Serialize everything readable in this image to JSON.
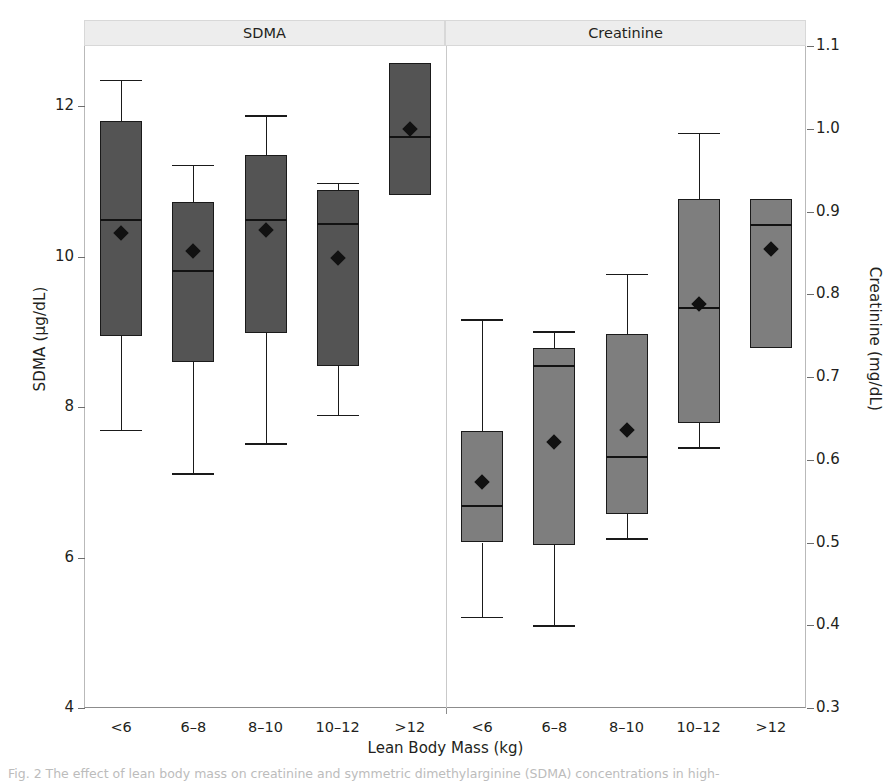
{
  "figure": {
    "xlabel": "Lean Body Mass (kg)",
    "caption": "Fig. 2  The effect of lean body mass on creatinine and symmetric dimethylarginine (SDMA) concentrations in high-"
  },
  "panels": [
    {
      "id": "sdma",
      "title": "SDMA"
    },
    {
      "id": "creatinine",
      "title": "Creatinine"
    }
  ],
  "axes": {
    "left": {
      "title": "SDMA (µg/dL)",
      "ticks": [
        "4",
        "6",
        "8",
        "10",
        "12"
      ]
    },
    "right": {
      "title": "Creatinine (mg/dL)",
      "ticks": [
        "0.3",
        "0.4",
        "0.5",
        "0.6",
        "0.7",
        "0.8",
        "0.9",
        "1.0",
        "1.1"
      ]
    }
  },
  "chart_data": {
    "type": "box",
    "title": "",
    "xlabel": "Lean Body Mass (kg)",
    "categories": [
      "<6",
      "6–8",
      "8–10",
      "10–12",
      ">12"
    ],
    "grid": false,
    "legend": null,
    "panels": [
      {
        "name": "SDMA",
        "ylabel": "SDMA (µg/dL)",
        "ylim": [
          4,
          12.8
        ],
        "yticks": [
          4,
          6,
          8,
          10,
          12
        ],
        "box_fill": "#545454",
        "boxes": [
          {
            "category": "<6",
            "whisker_low": 7.7,
            "q1": 8.95,
            "median": 10.5,
            "q3": 11.8,
            "whisker_high": 12.35,
            "mean": 10.32
          },
          {
            "category": "6–8",
            "whisker_low": 7.12,
            "q1": 8.6,
            "median": 9.82,
            "q3": 10.72,
            "whisker_high": 11.22,
            "mean": 10.08
          },
          {
            "category": "8–10",
            "whisker_low": 7.52,
            "q1": 8.98,
            "median": 10.5,
            "q3": 11.35,
            "whisker_high": 11.88,
            "mean": 10.35
          },
          {
            "category": "10–12",
            "whisker_low": 7.9,
            "q1": 8.55,
            "median": 10.45,
            "q3": 10.88,
            "whisker_high": 10.98,
            "mean": 9.98
          },
          {
            "category": ">12",
            "whisker_low": 10.82,
            "q1": 10.82,
            "median": 11.6,
            "q3": 12.58,
            "whisker_high": 12.58,
            "mean": 11.7
          }
        ]
      },
      {
        "name": "Creatinine",
        "ylabel": "Creatinine (mg/dL)",
        "ylim": [
          0.3,
          1.1
        ],
        "yticks": [
          0.3,
          0.4,
          0.5,
          0.6,
          0.7,
          0.8,
          0.9,
          1.0,
          1.1
        ],
        "box_fill": "#7e7e7e",
        "boxes": [
          {
            "category": "<6",
            "whisker_low": 0.41,
            "q1": 0.5,
            "median": 0.545,
            "q3": 0.635,
            "whisker_high": 0.77,
            "mean": 0.573
          },
          {
            "category": "6–8",
            "whisker_low": 0.4,
            "q1": 0.497,
            "median": 0.715,
            "q3": 0.735,
            "whisker_high": 0.755,
            "mean": 0.622
          },
          {
            "category": "8–10",
            "whisker_low": 0.505,
            "q1": 0.535,
            "median": 0.605,
            "q3": 0.752,
            "whisker_high": 0.825,
            "mean": 0.636
          },
          {
            "category": "10–12",
            "whisker_low": 0.615,
            "q1": 0.645,
            "median": 0.785,
            "q3": 0.915,
            "whisker_high": 0.995,
            "mean": 0.788
          },
          {
            "category": ">12",
            "whisker_low": 0.735,
            "q1": 0.735,
            "median": 0.885,
            "q3": 0.915,
            "whisker_high": 0.915,
            "mean": 0.855
          }
        ]
      }
    ]
  }
}
